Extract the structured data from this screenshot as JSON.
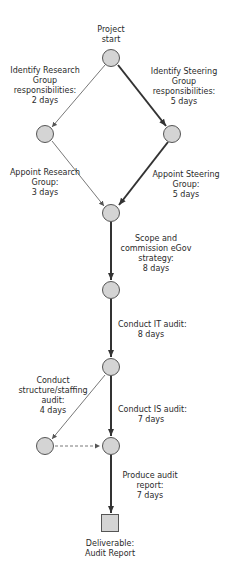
{
  "diagram": {
    "type": "critical-path network",
    "colors": {
      "node_fill": "#d4d4d4",
      "node_stroke": "#555555",
      "critical_edge": "#333333",
      "normal_edge": "#555555"
    },
    "nodes": [
      {
        "id": "start",
        "label": [
          "Project",
          "start"
        ]
      },
      {
        "id": "research",
        "label": []
      },
      {
        "id": "steering",
        "label": []
      },
      {
        "id": "merge",
        "label": []
      },
      {
        "id": "scope_done",
        "label": []
      },
      {
        "id": "it_done",
        "label": []
      },
      {
        "id": "staffing_done",
        "label": []
      },
      {
        "id": "is_done",
        "label": []
      },
      {
        "id": "deliverable",
        "shape": "square",
        "label": [
          "Deliverable:",
          "Audit Report"
        ]
      }
    ],
    "edges": [
      {
        "from": "start",
        "to": "research",
        "critical": false,
        "label": [
          "Identify Research",
          "Group",
          "responsibilities:",
          "2 days"
        ]
      },
      {
        "from": "start",
        "to": "steering",
        "critical": true,
        "label": [
          "Identify Steering",
          "Group",
          "responsibilities:",
          "5 days"
        ]
      },
      {
        "from": "research",
        "to": "merge",
        "critical": false,
        "label": [
          "Appoint  Research",
          "Group:",
          "3 days"
        ]
      },
      {
        "from": "steering",
        "to": "merge",
        "critical": true,
        "label": [
          "Appoint Steering",
          "Group:",
          "5 days"
        ]
      },
      {
        "from": "merge",
        "to": "scope_done",
        "critical": true,
        "label": [
          "Scope and",
          "commission eGov",
          "strategy:",
          "8 days"
        ]
      },
      {
        "from": "scope_done",
        "to": "it_done",
        "critical": true,
        "label": [
          "Conduct IT audit:",
          "8 days"
        ]
      },
      {
        "from": "it_done",
        "to": "staffing_done",
        "critical": false,
        "label": [
          "Conduct",
          "structure/staffing",
          "audit:",
          "4 days"
        ]
      },
      {
        "from": "it_done",
        "to": "is_done",
        "critical": true,
        "label": [
          "Conduct IS audit:",
          "7 days"
        ]
      },
      {
        "from": "staffing_done",
        "to": "is_done",
        "critical": false,
        "dashed": true,
        "label": []
      },
      {
        "from": "is_done",
        "to": "deliverable",
        "critical": true,
        "label": [
          "Produce audit",
          "report:",
          "7 days"
        ]
      }
    ]
  }
}
